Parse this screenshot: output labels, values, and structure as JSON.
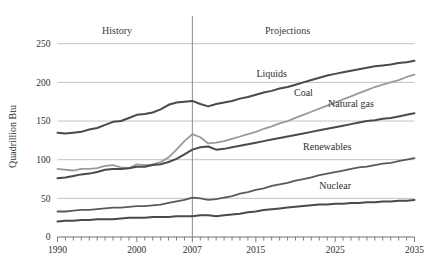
{
  "chart_data": {
    "type": "line",
    "title": "",
    "xlabel": "",
    "ylabel": "Quadrillion Btu",
    "xlim": [
      1990,
      2035
    ],
    "ylim": [
      0,
      260
    ],
    "yticks": [
      0,
      50,
      100,
      150,
      200,
      250
    ],
    "ytick_labels": [
      "0",
      "50",
      "100",
      "150",
      "200",
      "250"
    ],
    "xticks": [
      1990,
      2000,
      2007,
      2015,
      2025,
      2035
    ],
    "xtick_labels": [
      "1990",
      "2000",
      "2007",
      "2015",
      "2025",
      "2035"
    ],
    "minor_xtick_interval": 1,
    "grid": "horizontal",
    "legend_position": "inline-annotations",
    "annotations": [
      {
        "text": "History",
        "x": 1997.5,
        "y": 262
      },
      {
        "text": "Projections",
        "x": 2019,
        "y": 262
      }
    ],
    "divider": {
      "x": 2007,
      "label": "history-projection-divider",
      "color": "#8c8c8c"
    },
    "x": [
      1990,
      1991,
      1992,
      1993,
      1994,
      1995,
      1996,
      1997,
      1998,
      1999,
      2000,
      2001,
      2002,
      2003,
      2004,
      2005,
      2006,
      2007,
      2008,
      2009,
      2010,
      2011,
      2012,
      2013,
      2014,
      2015,
      2016,
      2017,
      2018,
      2019,
      2020,
      2021,
      2022,
      2023,
      2024,
      2025,
      2026,
      2027,
      2028,
      2029,
      2030,
      2031,
      2032,
      2033,
      2034,
      2035
    ],
    "series": [
      {
        "name": "Liquids",
        "color": "#4a4a4a",
        "width": 2.0,
        "label_x": 2017,
        "label_y": 207,
        "values": [
          135,
          134,
          135,
          136,
          139,
          141,
          145,
          149,
          150,
          154,
          158,
          159,
          161,
          165,
          171,
          174,
          175,
          176,
          172,
          169,
          172,
          174,
          176,
          179,
          181,
          184,
          187,
          189,
          192,
          194,
          197,
          200,
          203,
          206,
          209,
          211,
          213,
          215,
          217,
          219,
          221,
          222,
          223,
          225,
          226,
          228
        ]
      },
      {
        "name": "Coal",
        "color": "#9a9a9a",
        "width": 1.8,
        "label_x": 2021,
        "label_y": 183,
        "values": [
          88,
          87,
          86,
          88,
          88,
          89,
          92,
          93,
          90,
          89,
          94,
          93,
          94,
          97,
          103,
          113,
          124,
          133,
          129,
          121,
          122,
          124,
          127,
          130,
          133,
          136,
          140,
          143,
          147,
          150,
          154,
          158,
          162,
          166,
          170,
          174,
          178,
          182,
          186,
          190,
          194,
          197,
          200,
          203,
          207,
          210
        ]
      },
      {
        "name": "Natural gas",
        "color": "#4a4a4a",
        "width": 2.0,
        "label_x": 2027,
        "label_y": 168,
        "values": [
          76,
          77,
          79,
          81,
          82,
          84,
          87,
          88,
          88,
          89,
          91,
          91,
          93,
          94,
          97,
          101,
          107,
          113,
          116,
          117,
          113,
          114,
          116,
          118,
          120,
          122,
          124,
          126,
          128,
          130,
          132,
          134,
          136,
          138,
          140,
          142,
          144,
          146,
          148,
          150,
          151,
          153,
          154,
          156,
          158,
          160
        ]
      },
      {
        "name": "Renewables",
        "color": "#5a5a5a",
        "width": 1.8,
        "label_x": 2024,
        "label_y": 113,
        "values": [
          33,
          33,
          34,
          35,
          35,
          36,
          37,
          38,
          38,
          39,
          40,
          40,
          41,
          42,
          44,
          46,
          48,
          51,
          50,
          48,
          49,
          51,
          53,
          56,
          58,
          61,
          63,
          66,
          68,
          70,
          73,
          75,
          77,
          80,
          82,
          84,
          86,
          88,
          90,
          91,
          93,
          95,
          96,
          98,
          100,
          102
        ]
      },
      {
        "name": "Nuclear",
        "color": "#4a4a4a",
        "width": 2.0,
        "label_x": 2025,
        "label_y": 62,
        "values": [
          20,
          21,
          21,
          22,
          22,
          23,
          23,
          23,
          24,
          25,
          25,
          25,
          26,
          26,
          26,
          27,
          27,
          27,
          28,
          28,
          27,
          28,
          29,
          30,
          32,
          33,
          35,
          36,
          37,
          38,
          39,
          40,
          41,
          42,
          42,
          43,
          43,
          44,
          44,
          45,
          45,
          46,
          46,
          47,
          47,
          48
        ]
      }
    ]
  }
}
